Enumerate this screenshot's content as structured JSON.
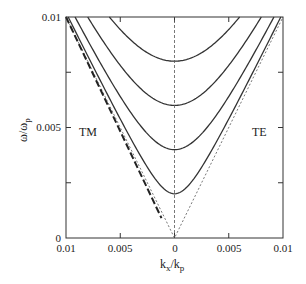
{
  "chart_data": {
    "type": "line",
    "title": "",
    "xlabel": "k_x/k_p",
    "ylabel": "ω/ω_p",
    "xlim": [
      -0.01,
      0.01
    ],
    "ylim": [
      0,
      0.01
    ],
    "x_tick_labels": [
      "0.01",
      "0.005",
      "0",
      "0.005",
      "0.01"
    ],
    "x_ticks": [
      -0.01,
      -0.005,
      0,
      0.005,
      0.01
    ],
    "y_tick_labels": [
      "0",
      "0.005",
      "0.01"
    ],
    "y_ticks": [
      0,
      0.005,
      0.01
    ],
    "y_minor_ticks": [
      0.0025,
      0.0075
    ],
    "grid": false,
    "annotations": [
      {
        "text": "TM",
        "x": -0.0085,
        "y": 0.0048
      },
      {
        "text": "TE",
        "x": 0.0085,
        "y": 0.0048
      }
    ],
    "series": [
      {
        "name": "mode-1",
        "style": "solid",
        "cutoff": 0.002,
        "relation": "ω = sqrt(0.002² + k²)"
      },
      {
        "name": "mode-2",
        "style": "solid",
        "cutoff": 0.004,
        "relation": "ω = sqrt(0.004² + k²)"
      },
      {
        "name": "mode-3",
        "style": "solid",
        "cutoff": 0.006,
        "relation": "ω = sqrt(0.006² + k²)"
      },
      {
        "name": "mode-4",
        "style": "solid",
        "cutoff": 0.008,
        "relation": "ω = sqrt(0.008² + k²)"
      },
      {
        "name": "light-line",
        "style": "dotted",
        "relation": "ω = |k|"
      },
      {
        "name": "TM-surface-mode",
        "style": "dashed-thick",
        "side": "left",
        "x": [
          -0.01,
          -0.0012
        ],
        "y": [
          0.01,
          0.0009
        ]
      },
      {
        "name": "k=0 axis",
        "style": "dotted",
        "x": [
          0,
          0
        ],
        "y": [
          0,
          0.01
        ]
      }
    ]
  },
  "labels": {
    "xlabel_main": "k",
    "xlabel_sub1": "x",
    "xlabel_slash": "/k",
    "xlabel_sub2": "p",
    "ylabel_main": "ω/ω",
    "ylabel_sub": "p",
    "tm": "TM",
    "te": "TE",
    "xt0": "0.01",
    "xt1": "0.005",
    "xt2": "0",
    "xt3": "0.005",
    "xt4": "0.01",
    "yt0": "0",
    "yt1": "0.005",
    "yt2": "0.01"
  }
}
